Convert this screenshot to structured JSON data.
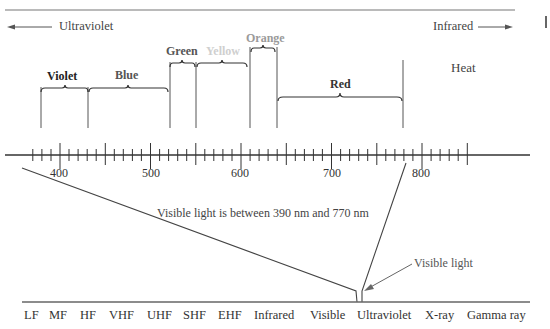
{
  "header": {
    "left_direction": "Ultraviolet",
    "right_direction": "Infrared",
    "heat_label": "Heat"
  },
  "bands": [
    {
      "name": "Violet",
      "start_nm": 390,
      "end_nm": 430,
      "color": "#333333"
    },
    {
      "name": "Blue",
      "start_nm": 430,
      "end_nm": 520,
      "color": "#555555"
    },
    {
      "name": "Green",
      "start_nm": 520,
      "end_nm": 550,
      "color": "#555555"
    },
    {
      "name": "Yellow",
      "start_nm": 550,
      "end_nm": 610,
      "color": "#c8c8c8"
    },
    {
      "name": "Orange",
      "start_nm": 610,
      "end_nm": 640,
      "color": "#999999"
    },
    {
      "name": "Red",
      "start_nm": 640,
      "end_nm": 780,
      "color": "#333333"
    }
  ],
  "scale": {
    "unit": "nm",
    "tick_labels": [
      "400",
      "500",
      "600",
      "700",
      "800"
    ],
    "minor_step": 10,
    "mid_step": 50,
    "major_step": 100
  },
  "annotations": {
    "range_note": "Visible light is between 390 nm and 770 nm",
    "pointer_label": "Visible light"
  },
  "spectrum": {
    "labels": [
      "LF",
      "MF",
      "HF",
      "VHF",
      "UHF",
      "SHF",
      "EHF",
      "Infrared",
      "Visible",
      "Ultraviolet",
      "X-ray",
      "Gamma ray"
    ]
  },
  "chart_data": {
    "type": "diagram",
    "axis": {
      "unit": "nm",
      "range": [
        370,
        850
      ],
      "ticks": [
        400,
        500,
        600,
        700,
        800
      ]
    },
    "bands": [
      {
        "name": "Violet",
        "range": [
          390,
          430
        ]
      },
      {
        "name": "Blue",
        "range": [
          430,
          520
        ]
      },
      {
        "name": "Green",
        "range": [
          520,
          550
        ]
      },
      {
        "name": "Yellow",
        "range": [
          550,
          610
        ]
      },
      {
        "name": "Orange",
        "range": [
          610,
          640
        ]
      },
      {
        "name": "Red",
        "range": [
          640,
          780
        ]
      }
    ],
    "regions": {
      "left": "Ultraviolet",
      "right": "Infrared",
      "beyond_red": "Heat"
    },
    "annotation": "Visible light is between 390 nm and 770 nm",
    "em_spectrum": [
      "LF",
      "MF",
      "HF",
      "VHF",
      "UHF",
      "SHF",
      "EHF",
      "Infrared",
      "Visible",
      "Ultraviolet",
      "X-ray",
      "Gamma ray"
    ]
  }
}
